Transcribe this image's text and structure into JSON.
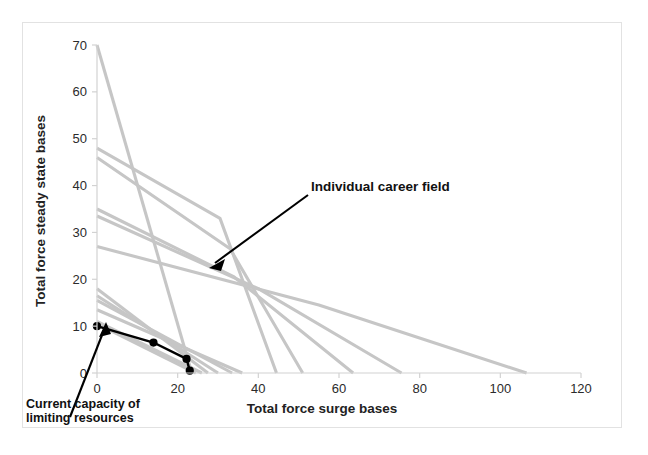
{
  "figure": {
    "background_color": "#ffffff",
    "frame_color": "#e2e2e2",
    "series_color": "#c6c6c6",
    "highlight_color": "#000000"
  },
  "annotations": {
    "career_field_label": "Individual career field",
    "caption_line1": "Current capacity of",
    "caption_line2": "limiting resources"
  },
  "chart_data": {
    "type": "line",
    "title": "",
    "xlabel": "Total force surge bases",
    "ylabel": "Total force steady state bases",
    "xlim": [
      0,
      120
    ],
    "ylim": [
      0,
      70
    ],
    "xticks": [
      0,
      20,
      40,
      60,
      80,
      100,
      120
    ],
    "yticks": [
      0,
      10,
      20,
      30,
      40,
      50,
      60,
      70
    ],
    "grid": false,
    "legend": "none",
    "series": [
      {
        "name": "Individual career field 1",
        "color": "#c6c6c6",
        "x": [
          0,
          23.5
        ],
        "y": [
          70,
          0
        ]
      },
      {
        "name": "Individual career field 2",
        "color": "#c6c6c6",
        "x": [
          0,
          30.5,
          44.5
        ],
        "y": [
          48,
          33,
          0
        ]
      },
      {
        "name": "Individual career field 3",
        "color": "#c6c6c6",
        "x": [
          0,
          33,
          51
        ],
        "y": [
          46,
          26.5,
          0
        ]
      },
      {
        "name": "Individual career field 4",
        "color": "#c6c6c6",
        "x": [
          0,
          34,
          63.5
        ],
        "y": [
          35,
          20.5,
          0
        ]
      },
      {
        "name": "Individual career field 5",
        "color": "#c6c6c6",
        "x": [
          0,
          40,
          75.5
        ],
        "y": [
          33.5,
          18,
          0
        ]
      },
      {
        "name": "Individual career field 6",
        "color": "#c6c6c6",
        "x": [
          0,
          55,
          106.5
        ],
        "y": [
          27,
          14.5,
          0
        ]
      },
      {
        "name": "Individual career field 7",
        "color": "#c6c6c6",
        "x": [
          0,
          27.5
        ],
        "y": [
          18,
          0
        ]
      },
      {
        "name": "Individual career field 8",
        "color": "#c6c6c6",
        "x": [
          0,
          30
        ],
        "y": [
          16.5,
          0
        ]
      },
      {
        "name": "Individual career field 9",
        "color": "#c6c6c6",
        "x": [
          0,
          33.5
        ],
        "y": [
          15.5,
          0
        ]
      },
      {
        "name": "Individual career field 10",
        "color": "#c6c6c6",
        "x": [
          0,
          36
        ],
        "y": [
          13.5,
          0
        ]
      },
      {
        "name": "Individual career field 11",
        "color": "#c6c6c6",
        "x": [
          0,
          26
        ],
        "y": [
          11,
          0
        ]
      },
      {
        "name": "Individual career field 12",
        "color": "#c6c6c6",
        "x": [
          0,
          24.5
        ],
        "y": [
          10.5,
          0
        ]
      }
    ],
    "highlight_series": {
      "name": "Current capacity of limiting resources",
      "color": "#000000",
      "markers": true,
      "x": [
        0,
        14,
        22.2,
        23
      ],
      "y": [
        10,
        6.5,
        3,
        0.5
      ]
    }
  }
}
